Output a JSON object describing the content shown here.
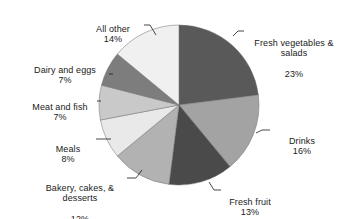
{
  "chart_data": {
    "type": "pie",
    "title": "",
    "subtitle": "",
    "xlabel": "",
    "ylabel": "",
    "legend_position": "none",
    "grid": false,
    "units": "percent",
    "start_angle_deg": 0,
    "direction": "clockwise",
    "categories": [
      "Fresh vegetables & salads",
      "Drinks",
      "Fresh fruit",
      "Bakery, cakes, & desserts",
      "Meals",
      "Meat and fish",
      "Dairy and eggs",
      "All other"
    ],
    "values": [
      23,
      16,
      13,
      12,
      8,
      7,
      7,
      14
    ],
    "colors": [
      "#595959",
      "#a3a3a3",
      "#4a4a4a",
      "#b2b2b2",
      "#e9e9e9",
      "#c9c9c9",
      "#7d7d7d",
      "#f0f0f0"
    ],
    "slices": [
      {
        "name": "Fresh vegetables & salads",
        "label_line1": "Fresh vegetables &",
        "label_line2": "salads",
        "value": 23,
        "value_label": "23%",
        "color": "#595959"
      },
      {
        "name": "Drinks",
        "label_line1": "Drinks",
        "label_line2": "",
        "value": 16,
        "value_label": "16%",
        "color": "#a3a3a3"
      },
      {
        "name": "Fresh fruit",
        "label_line1": "Fresh fruit",
        "label_line2": "",
        "value": 13,
        "value_label": "13%",
        "color": "#4a4a4a"
      },
      {
        "name": "Bakery, cakes, & desserts",
        "label_line1": "Bakery, cakes, &",
        "label_line2": "desserts",
        "value": 12,
        "value_label": "12%",
        "color": "#b2b2b2"
      },
      {
        "name": "Meals",
        "label_line1": "Meals",
        "label_line2": "",
        "value": 8,
        "value_label": "8%",
        "color": "#e9e9e9"
      },
      {
        "name": "Meat and fish",
        "label_line1": "Meat and fish",
        "label_line2": "",
        "value": 7,
        "value_label": "7%",
        "color": "#c9c9c9"
      },
      {
        "name": "Dairy and eggs",
        "label_line1": "Dairy and eggs",
        "label_line2": "",
        "value": 7,
        "value_label": "7%",
        "color": "#7d7d7d"
      },
      {
        "name": "All other",
        "label_line1": "All other",
        "label_line2": "",
        "value": 14,
        "value_label": "14%",
        "color": "#f0f0f0"
      }
    ]
  },
  "labels": {
    "fresh_vegetables": {
      "line1": "Fresh vegetables &",
      "line2": "salads",
      "pct": "23%"
    },
    "drinks": {
      "line1": "Drinks",
      "pct": "16%"
    },
    "fresh_fruit": {
      "line1": "Fresh fruit",
      "pct": "13%"
    },
    "bakery": {
      "line1": "Bakery, cakes, &",
      "line2": "desserts",
      "pct": "12%"
    },
    "meals": {
      "line1": "Meals",
      "pct": "8%"
    },
    "meat_and_fish": {
      "line1": "Meat and fish",
      "pct": "7%"
    },
    "dairy_and_eggs": {
      "line1": "Dairy and eggs",
      "pct": "7%"
    },
    "all_other": {
      "line1": "All other",
      "pct": "14%"
    }
  }
}
